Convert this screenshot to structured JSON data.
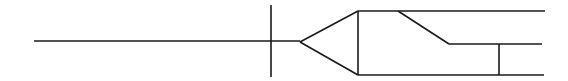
{
  "diagram": {
    "type": "line-schematic",
    "width": 568,
    "height": 81,
    "stroke_color": "#1a1a1a",
    "background": "#ffffff",
    "segments": [
      {
        "name": "input-line",
        "x1": 34,
        "y1": 41,
        "x2": 300,
        "y2": 41
      },
      {
        "name": "crossing-tick",
        "x1": 271,
        "y1": 5,
        "x2": 271,
        "y2": 77
      },
      {
        "name": "splitter-upper-edge",
        "x1": 300,
        "y1": 42,
        "x2": 358,
        "y2": 11
      },
      {
        "name": "splitter-lower-edge",
        "x1": 300,
        "y1": 42,
        "x2": 358,
        "y2": 75
      },
      {
        "name": "splitter-base",
        "x1": 358,
        "y1": 11,
        "x2": 358,
        "y2": 75
      },
      {
        "name": "top-output-line",
        "x1": 358,
        "y1": 11,
        "x2": 545,
        "y2": 11
      },
      {
        "name": "diagonal-branch",
        "x1": 398,
        "y1": 11,
        "x2": 449,
        "y2": 44
      },
      {
        "name": "middle-output-line",
        "x1": 449,
        "y1": 44,
        "x2": 542,
        "y2": 44
      },
      {
        "name": "middle-bottom-connector",
        "x1": 499,
        "y1": 44,
        "x2": 499,
        "y2": 75
      },
      {
        "name": "bottom-output-line",
        "x1": 358,
        "y1": 75,
        "x2": 544,
        "y2": 75
      }
    ]
  }
}
